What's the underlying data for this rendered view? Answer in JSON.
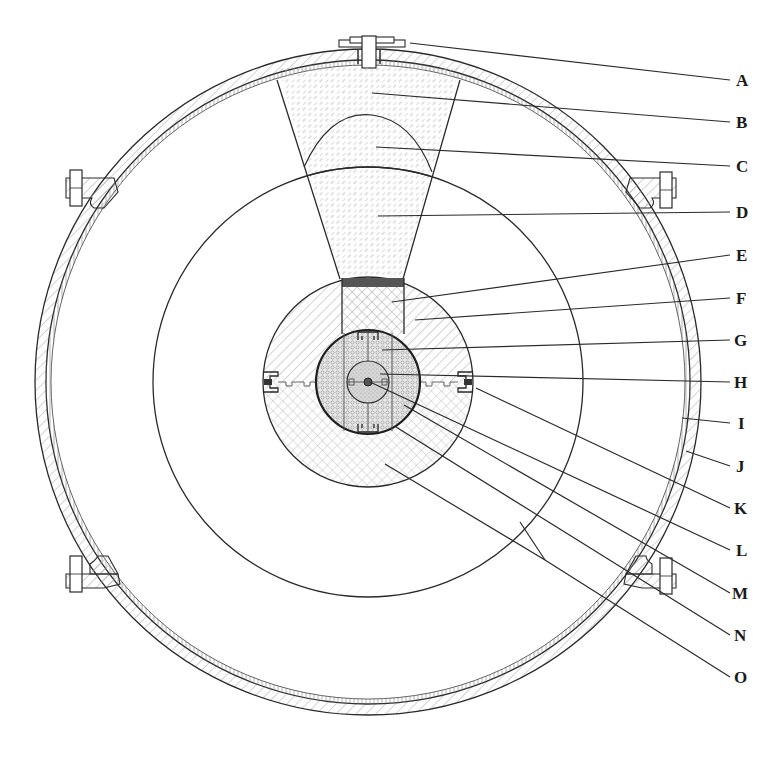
{
  "figure": {
    "type": "cross-section technical drawing"
  },
  "labels": [
    {
      "letter": "A",
      "x": 742,
      "y": 86,
      "from": [
        410,
        43
      ]
    },
    {
      "letter": "B",
      "x": 742,
      "y": 128,
      "from": [
        372,
        93
      ]
    },
    {
      "letter": "C",
      "x": 742,
      "y": 172,
      "from": [
        376,
        147
      ]
    },
    {
      "letter": "D",
      "x": 742,
      "y": 218,
      "from": [
        378,
        216
      ]
    },
    {
      "letter": "E",
      "x": 742,
      "y": 261,
      "from": [
        392,
        302
      ]
    },
    {
      "letter": "F",
      "x": 742,
      "y": 304,
      "from": [
        415,
        320
      ]
    },
    {
      "letter": "G",
      "x": 742,
      "y": 346,
      "from": [
        382,
        350
      ]
    },
    {
      "letter": "H",
      "x": 742,
      "y": 388,
      "from": [
        380,
        374
      ]
    },
    {
      "letter": "I",
      "x": 742,
      "y": 429,
      "from": [
        682,
        418
      ]
    },
    {
      "letter": "J",
      "x": 742,
      "y": 472,
      "from": [
        686,
        451
      ]
    },
    {
      "letter": "K",
      "x": 742,
      "y": 514,
      "from": [
        476,
        388
      ]
    },
    {
      "letter": "L",
      "x": 742,
      "y": 556,
      "from": [
        370,
        382
      ]
    },
    {
      "letter": "M",
      "x": 742,
      "y": 599,
      "from": [
        404,
        405
      ]
    },
    {
      "letter": "N",
      "x": 742,
      "y": 641,
      "from": [
        396,
        427
      ]
    },
    {
      "letter": "O",
      "x": 742,
      "y": 683,
      "from": [
        385,
        464
      ]
    }
  ],
  "colors": {
    "line": "#2a2a2a",
    "hatch": "#9a9a9a",
    "dark_band": "#555555",
    "background": "#ffffff"
  },
  "geometry": {
    "center": [
      368,
      382
    ],
    "shell_outer_r": 333,
    "shell_inner_r": 322,
    "liner_inner_r": 317,
    "large_circle_r": 215,
    "body_circle_r": 105,
    "core_circle_r": 52,
    "inner_core_r": 20
  }
}
